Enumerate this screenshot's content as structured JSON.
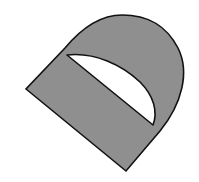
{
  "figure": {
    "description": "Gray rotated D-shaped solid with a white lens-shaped cutout",
    "colors": {
      "fill": "#8f8f8f",
      "outline": "#111111",
      "cutout": "#ffffff",
      "background": "#ffffff"
    },
    "shapes": [
      {
        "name": "d-shape-body",
        "kind": "filled-outline"
      },
      {
        "name": "lens-cutout",
        "kind": "hole"
      }
    ]
  }
}
